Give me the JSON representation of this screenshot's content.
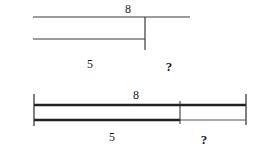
{
  "diagram_top": {
    "total_label": "8",
    "part_label": "5",
    "unknown_label": "?"
  },
  "diagram_bottom": {
    "total_label": "8",
    "part_label": "5",
    "unknown_label": "?"
  },
  "colors": {
    "line": "#2a2a2a",
    "background": "#ffffff"
  }
}
